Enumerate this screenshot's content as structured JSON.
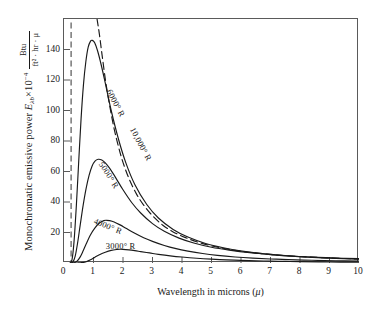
{
  "chart_data": {
    "type": "line",
    "title": "",
    "xlabel": "Wavelength in microns (μ)",
    "ylabel": "Monochromatic emissive power Eλb×10⁻⁴",
    "yunits_numerator": "Btu",
    "yunits_denominator": "ft² · hr · μ",
    "xlim": [
      0,
      10
    ],
    "ylim": [
      0,
      160
    ],
    "xticks": [
      "0",
      "1",
      "2",
      "3",
      "4",
      "5",
      "6",
      "7",
      "8",
      "9",
      "10"
    ],
    "yticks": [
      "20",
      "40",
      "60",
      "80",
      "100",
      "120",
      "140"
    ],
    "grid": false,
    "legend_position": "inline-curve-labels",
    "annotations": [
      {
        "text": "6000° R",
        "x": 1.75,
        "y": 105,
        "rotation": 62
      },
      {
        "text": "10,000° R",
        "x": 2.62,
        "y": 78,
        "rotation": 62
      },
      {
        "text": "5000° R",
        "x": 1.52,
        "y": 58,
        "rotation": 58
      },
      {
        "text": "4000° R",
        "x": 1.48,
        "y": 24,
        "rotation": 22
      },
      {
        "text": "3000° R",
        "x": 1.92,
        "y": 11,
        "rotation": 0
      }
    ],
    "series": [
      {
        "name": "3000° R",
        "style": "solid",
        "peak_x": 1.9,
        "peak_y": 9,
        "x": [
          0.3,
          0.45,
          0.6,
          0.75,
          0.9,
          1.05,
          1.2,
          1.4,
          1.6,
          1.8,
          1.9,
          2.0,
          2.2,
          2.4,
          2.6,
          2.9,
          3.2,
          3.6,
          4.0,
          4.5,
          5.0,
          5.5,
          6.0,
          6.5,
          7.0,
          7.5,
          8.0,
          9.0,
          10.0
        ],
        "y": [
          0.0,
          0.02,
          0.2,
          0.85,
          2.1,
          3.8,
          5.4,
          7.1,
          8.3,
          8.9,
          9.0,
          8.95,
          8.6,
          8.1,
          7.5,
          6.6,
          5.7,
          4.7,
          3.9,
          3.1,
          2.5,
          2.05,
          1.7,
          1.42,
          1.2,
          1.03,
          0.9,
          0.68,
          0.53
        ]
      },
      {
        "name": "4000° R",
        "style": "solid",
        "peak_x": 1.45,
        "peak_y": 28,
        "x": [
          0.25,
          0.35,
          0.45,
          0.55,
          0.65,
          0.75,
          0.9,
          1.05,
          1.2,
          1.35,
          1.45,
          1.55,
          1.7,
          1.9,
          2.1,
          2.4,
          2.7,
          3.0,
          3.4,
          3.8,
          4.2,
          4.7,
          5.2,
          5.8,
          6.4,
          7.0,
          7.6,
          8.4,
          9.2,
          10.0
        ],
        "y": [
          0.0,
          0.2,
          1.4,
          4.0,
          8.0,
          12.4,
          18.5,
          23.0,
          26.2,
          27.8,
          28.0,
          27.8,
          26.9,
          25.0,
          22.8,
          19.5,
          16.6,
          14.2,
          11.5,
          9.4,
          7.8,
          6.2,
          5.0,
          3.95,
          3.2,
          2.65,
          2.22,
          1.78,
          1.45,
          1.2
        ]
      },
      {
        "name": "5000° R",
        "style": "solid",
        "peak_x": 1.16,
        "peak_y": 68,
        "x": [
          0.22,
          0.3,
          0.38,
          0.46,
          0.55,
          0.65,
          0.75,
          0.85,
          0.95,
          1.05,
          1.16,
          1.28,
          1.4,
          1.55,
          1.75,
          2.0,
          2.3,
          2.6,
          3.0,
          3.4,
          3.9,
          4.4,
          5.0,
          5.6,
          6.3,
          7.0,
          7.8,
          8.6,
          9.4,
          10.0
        ],
        "y": [
          0.0,
          0.6,
          4.5,
          13.0,
          25.0,
          38.0,
          49.0,
          57.5,
          63.5,
          66.8,
          68.0,
          67.5,
          65.6,
          62.0,
          56.0,
          48.0,
          39.5,
          32.8,
          25.8,
          20.8,
          16.3,
          13.1,
          10.3,
          8.4,
          6.7,
          5.5,
          4.45,
          3.7,
          3.15,
          2.85
        ]
      },
      {
        "name": "6000° R",
        "style": "solid",
        "peak_x": 0.96,
        "peak_y": 146,
        "x": [
          0.2,
          0.27,
          0.34,
          0.42,
          0.5,
          0.58,
          0.66,
          0.74,
          0.82,
          0.9,
          0.96,
          1.04,
          1.14,
          1.26,
          1.4,
          1.6,
          1.85,
          2.1,
          2.4,
          2.8,
          3.2,
          3.7,
          4.2,
          4.8,
          5.4,
          6.1,
          6.8,
          7.6,
          8.6,
          10.0
        ],
        "y": [
          0.0,
          2.0,
          14.0,
          38.0,
          67.0,
          95.0,
          117.0,
          132.0,
          141.5,
          145.5,
          146.0,
          144.5,
          139.0,
          130.0,
          118.0,
          100.0,
          81.0,
          65.5,
          51.5,
          38.5,
          29.5,
          22.0,
          17.0,
          12.8,
          10.0,
          7.6,
          5.95,
          4.65,
          3.55,
          2.5
        ]
      },
      {
        "name": "10,000° R",
        "style": "dashed",
        "peak_x": 0.58,
        "peak_y": 1130,
        "note": "off-scale peak; only descending tail visible",
        "x": [
          1.12,
          1.2,
          1.3,
          1.42,
          1.55,
          1.7,
          1.85,
          2.0,
          2.2,
          2.45,
          2.7,
          3.0,
          3.35,
          3.7,
          4.1,
          4.55,
          5.05,
          5.6,
          6.2,
          6.9,
          7.7,
          8.6,
          9.5,
          10.0
        ],
        "y": [
          160.0,
          150.0,
          135.0,
          118.0,
          103.0,
          88.0,
          76.0,
          66.0,
          55.5,
          45.5,
          38.0,
          31.0,
          24.8,
          20.4,
          16.8,
          13.6,
          11.0,
          8.9,
          7.2,
          5.8,
          4.6,
          3.65,
          2.95,
          2.65
        ]
      }
    ],
    "reference_line": {
      "name": "visible-band-marker",
      "style": "dash-dot",
      "x": 0.24,
      "orientation": "vertical"
    }
  },
  "colors": {
    "axis": "#5a5a5a",
    "curve": "#1a1a1a",
    "text": "#1a1a1a",
    "background": "#ffffff"
  }
}
